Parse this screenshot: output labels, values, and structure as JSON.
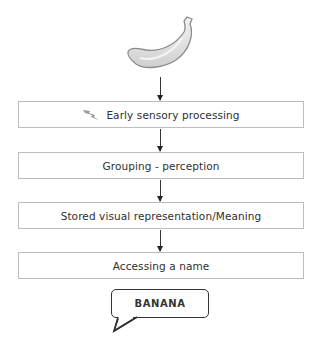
{
  "diagram": {
    "stimulus": {
      "name": "banana",
      "icon": "banana-icon"
    },
    "stages": [
      {
        "label": "Early sensory processing",
        "icon": "lightning-icon"
      },
      {
        "label": "Grouping - perception"
      },
      {
        "label": "Stored visual representation/Meaning"
      },
      {
        "label": "Accessing a name"
      }
    ],
    "output": {
      "label": "BANANA",
      "shape": "speech-bubble"
    },
    "colors": {
      "box_border": "#bdbdbd",
      "arrow": "#333333",
      "text": "#2f2f2f",
      "banana_fill": "#e6e6e6"
    }
  }
}
